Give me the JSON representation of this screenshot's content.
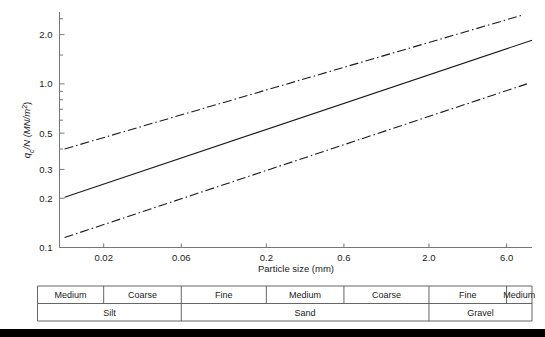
{
  "figure": {
    "background_color": "#ffffff",
    "line_color": "#1a1a1a",
    "axis_color": "#777777",
    "bottom_bar_color": "#000000"
  },
  "chart_data": {
    "type": "line",
    "title": "",
    "subtitle": "",
    "xlabel": "Particle size (mm)",
    "ylabel": "qc/N (MN/m2)",
    "ylabel_rich": {
      "main": "q",
      "sub": "c",
      "rest": "/N (MN/m",
      "sup": "2",
      "tail": ")"
    },
    "xscale": "log",
    "yscale": "log",
    "xlim": [
      0.0107,
      8.6
    ],
    "ylim": [
      0.1,
      2.75
    ],
    "grid": false,
    "legend": "none",
    "xticks": [
      0.02,
      0.06,
      0.2,
      0.6,
      2.0,
      6.0
    ],
    "xticklabels": [
      "0.02",
      "0.06",
      "0.2",
      "0.6",
      "2.0",
      "6.0"
    ],
    "yticks": [
      0.1,
      0.2,
      0.3,
      0.5,
      1.0,
      2.0
    ],
    "yticklabels": [
      "0.1",
      "0.2",
      "0.3",
      "0.5",
      "1.0",
      "2.0"
    ],
    "yminorticks": [
      0.4,
      0.6,
      0.7,
      0.8,
      0.9,
      1.5,
      2.5
    ],
    "series": [
      {
        "name": "upper bound",
        "style": "dash-dot",
        "x": [
          0.0115,
          7.4
        ],
        "y": [
          0.4,
          2.62
        ]
      },
      {
        "name": "mean",
        "style": "solid",
        "x": [
          0.0115,
          8.6
        ],
        "y": [
          0.203,
          1.85
        ]
      },
      {
        "name": "lower bound",
        "style": "dash-dot",
        "x": [
          0.0115,
          8.0
        ],
        "y": [
          0.115,
          1.0
        ]
      }
    ]
  },
  "classification_table": {
    "row1_label": "grading",
    "row2_label": "soil type",
    "row1": [
      {
        "label": "Medium",
        "x_from": 0.0107,
        "x_to": 0.02
      },
      {
        "label": "Coarse",
        "x_from": 0.02,
        "x_to": 0.06
      },
      {
        "label": "Fine",
        "x_from": 0.06,
        "x_to": 0.2
      },
      {
        "label": "Medium",
        "x_from": 0.2,
        "x_to": 0.6
      },
      {
        "label": "Coarse",
        "x_from": 0.6,
        "x_to": 2.0
      },
      {
        "label": "Fine",
        "x_from": 2.0,
        "x_to": 6.0
      },
      {
        "label": "Medium",
        "x_from": 6.0,
        "x_to": 8.6
      }
    ],
    "row2": [
      {
        "label": "Silt",
        "x_from": 0.0107,
        "x_to": 0.06
      },
      {
        "label": "Sand",
        "x_from": 0.06,
        "x_to": 2.0
      },
      {
        "label": "Gravel",
        "x_from": 2.0,
        "x_to": 8.6
      }
    ]
  }
}
